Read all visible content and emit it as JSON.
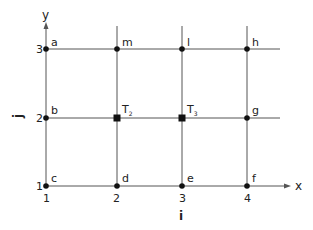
{
  "diagram": {
    "title": "",
    "axes": {
      "x_label": "x",
      "y_label": "y",
      "i_label": "i",
      "j_label": "j",
      "x_ticks": [
        "1",
        "2",
        "3",
        "4"
      ],
      "y_ticks": [
        "1",
        "2",
        "3"
      ]
    },
    "nodes": [
      {
        "id": "a",
        "label": "a",
        "i": 1,
        "j": 3,
        "marker": "dot"
      },
      {
        "id": "m",
        "label": "m",
        "i": 2,
        "j": 3,
        "marker": "dot"
      },
      {
        "id": "l",
        "label": "l",
        "i": 3,
        "j": 3,
        "marker": "dot"
      },
      {
        "id": "h",
        "label": "h",
        "i": 4,
        "j": 3,
        "marker": "dot"
      },
      {
        "id": "b",
        "label": "b",
        "i": 1,
        "j": 2,
        "marker": "dot"
      },
      {
        "id": "T2",
        "label": "T",
        "subscript": "2",
        "i": 2,
        "j": 2,
        "marker": "square"
      },
      {
        "id": "T3",
        "label": "T",
        "subscript": "3",
        "i": 3,
        "j": 2,
        "marker": "square"
      },
      {
        "id": "g",
        "label": "g",
        "i": 4,
        "j": 2,
        "marker": "dot"
      },
      {
        "id": "c",
        "label": "c",
        "i": 1,
        "j": 1,
        "marker": "dot"
      },
      {
        "id": "d",
        "label": "d",
        "i": 2,
        "j": 1,
        "marker": "dot"
      },
      {
        "id": "e",
        "label": "e",
        "i": 3,
        "j": 1,
        "marker": "dot"
      },
      {
        "id": "f",
        "label": "f",
        "i": 4,
        "j": 1,
        "marker": "dot"
      }
    ]
  }
}
